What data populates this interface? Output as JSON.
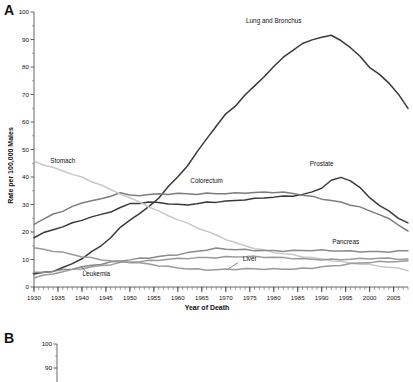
{
  "figure": {
    "panels": [
      {
        "letter": "A"
      },
      {
        "letter": "B"
      }
    ]
  },
  "chart_data": {
    "type": "line",
    "title": "",
    "xlabel": "Year of Death",
    "ylabel": "Rate per 100,000 Males",
    "xlim": [
      1930,
      2008
    ],
    "ylim": [
      0,
      100
    ],
    "ytick_step": 10,
    "xtick_step": 5,
    "minor_xtick_step": 1,
    "grid": false,
    "legend_position": "inline-annotations",
    "ytick_labels": [
      "0",
      "10",
      "20",
      "30",
      "40",
      "50",
      "60",
      "70",
      "80",
      "90",
      "100"
    ],
    "xtick_labels": [
      "1930",
      "1935",
      "1940",
      "1945",
      "1950",
      "1955",
      "1960",
      "1965",
      "1970",
      "1975",
      "1980",
      "1985",
      "1990",
      "1995",
      "2000",
      "2005"
    ],
    "x": [
      1930,
      1932,
      1934,
      1936,
      1938,
      1940,
      1942,
      1944,
      1946,
      1948,
      1950,
      1952,
      1954,
      1956,
      1958,
      1960,
      1962,
      1964,
      1966,
      1968,
      1970,
      1972,
      1974,
      1976,
      1978,
      1980,
      1982,
      1984,
      1986,
      1988,
      1990,
      1992,
      1994,
      1996,
      1998,
      2000,
      2002,
      2004,
      2006,
      2008
    ],
    "series": [
      {
        "name": "Lung and Bronchus",
        "color": "#3a3a3a",
        "label": "Lung and Bronchus",
        "label_x": 1980,
        "label_y": 96,
        "values": [
          4.7,
          5.3,
          6.1,
          7.2,
          8.6,
          10.5,
          12.6,
          14.9,
          17.8,
          21.3,
          24.4,
          26.7,
          29.3,
          32.7,
          36.6,
          40.2,
          44.2,
          48.8,
          53.8,
          58.3,
          62.6,
          65.9,
          69.8,
          73.2,
          76.9,
          80.2,
          83.7,
          86.2,
          88.2,
          89.8,
          90.6,
          91.2,
          89.8,
          87.0,
          84.0,
          80.2,
          77.4,
          74.3,
          70.2,
          64.6
        ]
      },
      {
        "name": "Prostate",
        "color": "#3a3a3a",
        "label": "Prostate",
        "label_x": 1990,
        "label_y": 44,
        "values": [
          17.9,
          19.4,
          20.8,
          22.0,
          23.3,
          24.6,
          25.7,
          26.4,
          27.5,
          28.7,
          30.1,
          30.3,
          30.5,
          30.7,
          30.3,
          30.0,
          30.2,
          30.4,
          30.9,
          31.0,
          31.0,
          31.3,
          31.6,
          31.9,
          32.4,
          32.8,
          33.1,
          33.4,
          33.8,
          34.6,
          36.1,
          38.5,
          39.7,
          38.5,
          35.8,
          32.6,
          29.8,
          27.7,
          25.4,
          23.4
        ]
      },
      {
        "name": "Colorectum",
        "color": "#7d7d7d",
        "label": "Colorectum",
        "label_x": 1966,
        "label_y": 38,
        "values": [
          23.0,
          24.6,
          26.2,
          27.5,
          29.0,
          30.4,
          31.6,
          32.0,
          33.3,
          34.6,
          33.4,
          33.4,
          33.5,
          33.6,
          33.6,
          33.8,
          33.8,
          33.9,
          34.1,
          34.2,
          34.2,
          34.2,
          34.3,
          34.2,
          34.2,
          34.3,
          34.2,
          34.0,
          33.6,
          33.0,
          32.3,
          31.7,
          30.8,
          29.9,
          28.9,
          27.4,
          26.3,
          24.6,
          22.5,
          20.6
        ]
      },
      {
        "name": "Stomach",
        "color": "#c8c8c8",
        "label": "Stomach",
        "label_x": 1936,
        "label_y": 45,
        "values": [
          45.9,
          44.7,
          43.5,
          42.3,
          41.0,
          39.6,
          38.2,
          36.9,
          35.2,
          34.0,
          32.5,
          31.1,
          29.4,
          27.6,
          26.0,
          24.4,
          22.9,
          21.4,
          20.1,
          18.7,
          17.5,
          16.2,
          15.2,
          14.3,
          13.4,
          12.6,
          12.0,
          11.4,
          10.9,
          10.5,
          10.1,
          9.8,
          9.4,
          9.0,
          8.6,
          8.1,
          7.6,
          7.1,
          6.5,
          5.9
        ]
      },
      {
        "name": "Pancreas",
        "color": "#8a8a8a",
        "label": "Pancreas",
        "label_x": 1995,
        "label_y": 15.5,
        "values": [
          5.0,
          5.4,
          5.9,
          6.4,
          6.9,
          7.4,
          7.9,
          8.3,
          8.8,
          9.2,
          9.8,
          10.2,
          10.7,
          11.2,
          11.6,
          12.1,
          12.5,
          13.0,
          13.4,
          13.8,
          13.6,
          13.5,
          13.5,
          13.4,
          13.4,
          13.4,
          13.3,
          13.3,
          13.2,
          13.2,
          13.1,
          13.0,
          13.0,
          13.0,
          13.0,
          13.0,
          13.0,
          13.0,
          13.1,
          13.2
        ]
      },
      {
        "name": "Liver",
        "color": "#9a9a9a",
        "label": "Liver",
        "label_x": 1975,
        "label_y": 9.6,
        "values": [
          14.0,
          13.4,
          12.9,
          12.4,
          11.9,
          11.2,
          10.7,
          10.2,
          9.7,
          9.3,
          8.9,
          8.5,
          8.1,
          7.7,
          7.3,
          7.0,
          6.8,
          6.6,
          6.5,
          6.4,
          6.4,
          6.4,
          6.4,
          6.4,
          6.4,
          6.5,
          6.6,
          6.7,
          6.9,
          7.1,
          7.4,
          7.6,
          7.9,
          8.2,
          8.5,
          8.8,
          9.1,
          9.3,
          9.5,
          9.6
        ]
      },
      {
        "name": "Leukemia",
        "color": "#9a9a9a",
        "label": "Leukemia",
        "label_x": 1943,
        "label_y": 4.0,
        "values": [
          3.6,
          4.2,
          4.8,
          5.4,
          6.0,
          6.6,
          7.2,
          7.8,
          8.4,
          9.0,
          9.3,
          9.4,
          9.5,
          9.7,
          9.9,
          10.1,
          10.3,
          10.5,
          10.7,
          10.9,
          11.1,
          11.2,
          11.2,
          11.0,
          10.8,
          10.6,
          10.4,
          10.3,
          10.2,
          10.2,
          10.2,
          10.2,
          10.2,
          10.2,
          10.2,
          10.2,
          10.2,
          10.2,
          10.1,
          10.0
        ]
      }
    ],
    "panelB": {
      "ylim": [
        0,
        100
      ],
      "visible_ytick_labels": [
        "100",
        "90"
      ]
    }
  }
}
